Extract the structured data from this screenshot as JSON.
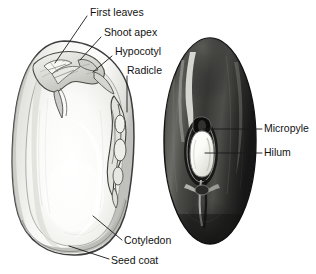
{
  "figure": {
    "background_color": "#ffffff",
    "text_color": "#121212",
    "leader_color": "#1a1a1a"
  },
  "specimens": [
    {
      "name": "split-bean-longitudinal-section",
      "description": "Pale kidney-shaped bean split open showing interior",
      "fill_light": "#fbfbfa",
      "fill_mid": "#e8e8e6",
      "fill_shadow": "#c9c9c6",
      "outline_color": "#3d3d3d"
    },
    {
      "name": "whole-bean-exterior",
      "description": "Dark glossy whole bean showing seed coat exterior",
      "fill_dark": "#2b2b2b",
      "fill_mid": "#565654",
      "fill_highlight": "#d8d8d4",
      "outline_color": "#151515"
    }
  ],
  "labels": [
    {
      "id": "first-leaves",
      "text": "First leaves",
      "text_x": 90,
      "text_y": 13,
      "anchor": "start",
      "leader": "M 87 16 L 55 63"
    },
    {
      "id": "shoot-apex",
      "text": "Shoot apex",
      "text_x": 104,
      "text_y": 33,
      "anchor": "start",
      "leader": "M 101 37 L 80 60"
    },
    {
      "id": "hypocotyl",
      "text": "Hypocotyl",
      "text_x": 115,
      "text_y": 52,
      "anchor": "start",
      "leader": "M 112 56 L 93 72"
    },
    {
      "id": "radicle",
      "text": "Radicle",
      "text_x": 127,
      "text_y": 71,
      "anchor": "start",
      "leader": "M 127 76 L 127 112"
    },
    {
      "id": "cotyledon",
      "text": "Cotyledon",
      "text_x": 124,
      "text_y": 241,
      "anchor": "start",
      "leader": "M 122 240 L 93 216"
    },
    {
      "id": "seed-coat",
      "text": "Seed coat",
      "text_x": 111,
      "text_y": 261,
      "anchor": "start",
      "leader": "M 109 259 L 69 246"
    },
    {
      "id": "micropyle",
      "text": "Micropyle",
      "text_x": 264,
      "text_y": 129,
      "anchor": "start",
      "leader": "M 262 129 L 203 129"
    },
    {
      "id": "hilum",
      "text": "Hilum",
      "text_x": 264,
      "text_y": 153,
      "anchor": "start",
      "leader": "M 262 153 L 205 153"
    }
  ]
}
